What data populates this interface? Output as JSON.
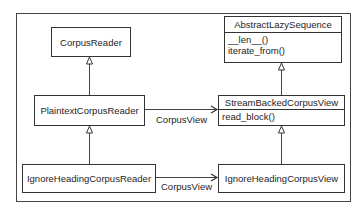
{
  "diagram": {
    "type": "uml-class-diagram",
    "classes": {
      "corpus_reader": {
        "name": "CorpusReader"
      },
      "plaintext_corpus_reader": {
        "name": "PlaintextCorpusReader"
      },
      "ignore_heading_corpus_reader": {
        "name": "IgnoreHeadingCorpusReader"
      },
      "abstract_lazy_sequence": {
        "name": "AbstractLazySequence",
        "methods": [
          "__len__()",
          "iterate_from()"
        ]
      },
      "stream_backed_corpus_view": {
        "name": "StreamBackedCorpusView",
        "methods": [
          "read_block()"
        ]
      },
      "ignore_heading_corpus_view": {
        "name": "IgnoreHeadingCorpusView"
      }
    },
    "relations": [
      {
        "from": "PlaintextCorpusReader",
        "to": "CorpusReader",
        "kind": "inheritance"
      },
      {
        "from": "IgnoreHeadingCorpusReader",
        "to": "PlaintextCorpusReader",
        "kind": "inheritance"
      },
      {
        "from": "StreamBackedCorpusView",
        "to": "AbstractLazySequence",
        "kind": "inheritance"
      },
      {
        "from": "IgnoreHeadingCorpusView",
        "to": "StreamBackedCorpusView",
        "kind": "inheritance"
      },
      {
        "from": "PlaintextCorpusReader",
        "to": "StreamBackedCorpusView",
        "kind": "association",
        "label": "CorpusView"
      },
      {
        "from": "IgnoreHeadingCorpusReader",
        "to": "IgnoreHeadingCorpusView",
        "kind": "association",
        "label": "CorpusView"
      }
    ],
    "edge_labels": {
      "top": "CorpusView",
      "bottom": "CorpusView"
    },
    "colors": {
      "line": "#333333",
      "text": "#1e1e1e",
      "background": "#ffffff"
    }
  }
}
